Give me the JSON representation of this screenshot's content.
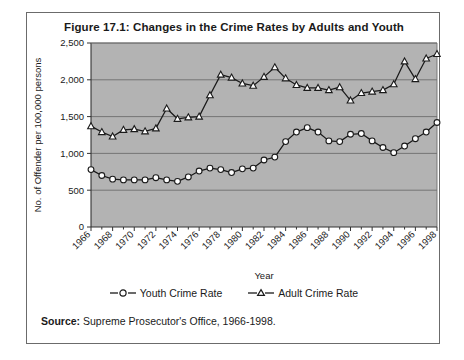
{
  "figure": {
    "title": "Figure 17.1: Changes in the Crime Rates by Adults and Youth",
    "source_label": "Source:",
    "source_text": "Supreme Prosecutor's Office, 1966-1998."
  },
  "legend": {
    "youth_label": "Youth Crime Rate",
    "adult_label": "Adult Crime Rate"
  },
  "chart_data": {
    "type": "line",
    "title": "Figure 17.1: Changes in the Crime Rates by Adults and Youth",
    "xlabel": "Year",
    "ylabel": "No. of Offender per 100,000 persons",
    "ylim": [
      0,
      2500
    ],
    "yticks": [
      0,
      500,
      1000,
      1500,
      2000,
      2500
    ],
    "ytick_labels": [
      "0",
      "500",
      "1,000",
      "1,500",
      "2,000",
      "2,500"
    ],
    "grid": true,
    "legend_position": "bottom",
    "plot_background": "#b3b3b3",
    "x": [
      1966,
      1967,
      1968,
      1969,
      1970,
      1971,
      1972,
      1973,
      1974,
      1975,
      1976,
      1977,
      1978,
      1979,
      1980,
      1981,
      1982,
      1983,
      1984,
      1985,
      1986,
      1987,
      1988,
      1989,
      1990,
      1991,
      1992,
      1993,
      1994,
      1995,
      1996,
      1997,
      1998
    ],
    "xtick_labels": [
      "1966",
      "1968",
      "1970",
      "1972",
      "1974",
      "1976",
      "1978",
      "1980",
      "1982",
      "1984",
      "1986",
      "1988",
      "1990",
      "1992",
      "1994",
      "1996",
      "1998"
    ],
    "xtick_values": [
      1966,
      1968,
      1970,
      1972,
      1974,
      1976,
      1978,
      1980,
      1982,
      1984,
      1986,
      1988,
      1990,
      1992,
      1994,
      1996,
      1998
    ],
    "series": [
      {
        "name": "Youth Crime Rate",
        "marker": "circle",
        "color": "#1a1a1a",
        "values": [
          780,
          700,
          650,
          640,
          640,
          640,
          670,
          640,
          620,
          680,
          760,
          800,
          780,
          740,
          790,
          800,
          910,
          950,
          1160,
          1290,
          1350,
          1290,
          1170,
          1160,
          1260,
          1270,
          1170,
          1080,
          1010,
          1100,
          1200,
          1290,
          1420
        ]
      },
      {
        "name": "Adult Crime Rate",
        "marker": "triangle",
        "color": "#1a1a1a",
        "values": [
          1370,
          1290,
          1230,
          1320,
          1330,
          1300,
          1340,
          1610,
          1470,
          1490,
          1500,
          1790,
          2070,
          2030,
          1950,
          1920,
          2040,
          2170,
          2020,
          1930,
          1890,
          1890,
          1860,
          1900,
          1720,
          1820,
          1840,
          1860,
          1940,
          2250,
          2010,
          2290,
          2350
        ]
      }
    ]
  }
}
